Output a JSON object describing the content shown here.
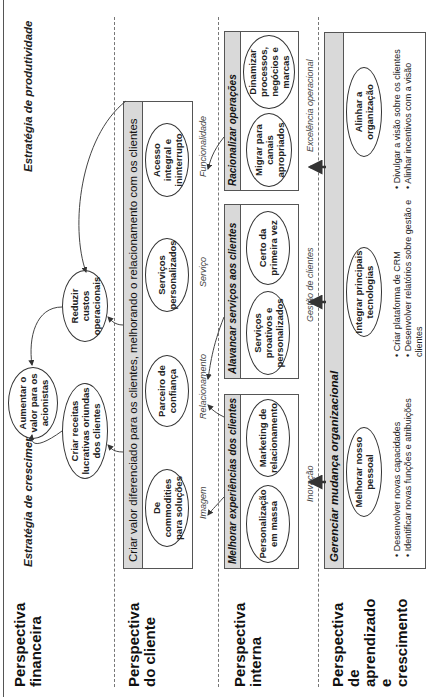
{
  "perspectives": {
    "financial": "Perspectiva financeira",
    "customer": "Perspectiva do cliente",
    "internal": "Perspectiva interna",
    "learning": "Perspectiva de aprendizado e crescimento"
  },
  "financial": {
    "growth_strategy": "Estratégia de crescimento",
    "productivity_strategy": "Estratégia de produtividade",
    "goal_center": "Aumentar o valor para os acionistas",
    "goal_growth": "Criar receitas lucrativas oriundas dos clientes",
    "goal_productivity": "Reduzir custos operacionais"
  },
  "customer": {
    "header": "Criar valor diferenciado para os clientes, melhorando o relacionamento com os clientes",
    "items": [
      "De commodities para soluções",
      "Parceiro de confiança",
      "Serviços personalizados",
      "Acesso integral e ininterrupto"
    ],
    "labels": [
      "Imagem",
      "Relacionamento",
      "Serviço",
      "Funcionalidade"
    ]
  },
  "internal": {
    "boxes": [
      {
        "header": "Melhorar experiências dos clientes",
        "items": [
          "Personalização em massa",
          "Marketing de relacionamento"
        ]
      },
      {
        "header": "Alavancar serviços aos clientes",
        "items": [
          "Serviços proativos e personalizados",
          "Certo da primeira vez"
        ]
      },
      {
        "header": "Racionalizar operações",
        "items": [
          "Migrar para canais apropriados",
          "Dinamizar processos, negócios e marcas"
        ]
      }
    ],
    "labels": [
      "Inovação",
      "Gestão de clientes",
      "Excelência operacional"
    ]
  },
  "learning": {
    "header": "Gerenciar mudança organizacional",
    "columns": [
      {
        "goal": "Melhorar nosso pessoal",
        "bullets": [
          "Desenvolver novas capacidades",
          "Identificar novas funções e atribuições"
        ]
      },
      {
        "goal": "Integrar principais tecnologias",
        "bullets": [
          "Criar plataforma de CRM",
          "Desenvolver relatórios sobre gestão e clientes"
        ]
      },
      {
        "goal": "Alinhar a organização",
        "bullets": [
          "Divulgar a visão sobre os clientes",
          "Alinhar incentivos com a visão"
        ]
      }
    ]
  }
}
